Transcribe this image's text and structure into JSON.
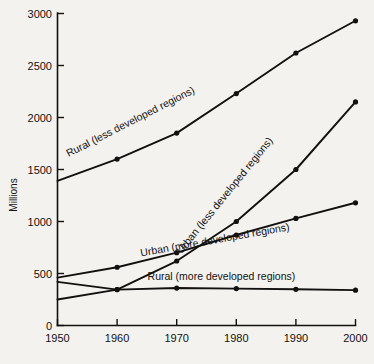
{
  "chart_data": {
    "type": "line",
    "title": "",
    "xlabel": "",
    "ylabel": "Millions",
    "xlim": [
      1950,
      2000
    ],
    "ylim": [
      0,
      3000
    ],
    "grid": false,
    "legend_position": "inline-labels",
    "x": [
      1950,
      1960,
      1970,
      1980,
      1990,
      2000
    ],
    "xticks": [
      "1950",
      "1960",
      "1970",
      "1980",
      "1990",
      "2000"
    ],
    "yticks": [
      "0",
      "500",
      "1000",
      "1500",
      "2000",
      "2500",
      "3000"
    ],
    "ytick_values": [
      0,
      500,
      1000,
      1500,
      2000,
      2500,
      3000
    ],
    "series": [
      {
        "name": "Rural (less developed regions)",
        "label": "Rural (less developed regions)",
        "values": [
          1390,
          1600,
          1850,
          2230,
          2620,
          2930
        ],
        "markers": [
          false,
          true,
          true,
          true,
          true,
          true
        ]
      },
      {
        "name": "Urban (less developed regions)",
        "label": "Urban (less developed regions)",
        "values": [
          250,
          345,
          620,
          1000,
          1500,
          2150
        ],
        "markers": [
          false,
          true,
          true,
          true,
          true,
          true
        ]
      },
      {
        "name": "Urban (more developed regions)",
        "label": "Urban (more developed regions)",
        "values": [
          460,
          560,
          700,
          870,
          1030,
          1180
        ],
        "markers": [
          false,
          true,
          true,
          true,
          true,
          true
        ]
      },
      {
        "name": "Rural (more developed regions)",
        "label": "Rural (more developed regions)",
        "values": [
          420,
          345,
          360,
          355,
          348,
          340
        ],
        "markers": [
          false,
          true,
          true,
          true,
          true,
          true
        ]
      }
    ],
    "annotations": [
      {
        "text": "Rural (less developed regions)",
        "x": 1962.5,
        "y": 1930,
        "rotation": -27
      },
      {
        "text": "Urban (less developed regions)",
        "x": 1978.5,
        "y": 1230,
        "rotation": -51
      },
      {
        "text": "Urban (more developed regions)",
        "x": 1976.5,
        "y": 790,
        "rotation": -10
      },
      {
        "text": "Rural (more developed regions)",
        "x": 1977.5,
        "y": 440,
        "rotation": 0
      }
    ],
    "colors": {
      "ink": "#13110f",
      "background": "#f4f2ef"
    }
  }
}
